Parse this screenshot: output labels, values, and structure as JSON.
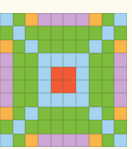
{
  "palette": {
    "B": "#a4d4f2",
    "G": "#7dbc3c",
    "O": "#f8b54a",
    "P": "#cda6d6",
    "R": "#f25a36"
  },
  "grid": {
    "rows": 10,
    "cols": 10,
    "cells": [
      [
        "B",
        "G",
        "O",
        "P",
        "P",
        "P",
        "P",
        "O",
        "G",
        "B"
      ],
      [
        "G",
        "B",
        "G",
        "G",
        "G",
        "G",
        "G",
        "G",
        "B",
        "G"
      ],
      [
        "O",
        "G",
        "B",
        "G",
        "G",
        "G",
        "G",
        "B",
        "G",
        "O"
      ],
      [
        "P",
        "G",
        "G",
        "B",
        "B",
        "B",
        "B",
        "G",
        "G",
        "P"
      ],
      [
        "P",
        "G",
        "G",
        "B",
        "R",
        "R",
        "B",
        "G",
        "G",
        "P"
      ],
      [
        "P",
        "G",
        "G",
        "B",
        "R",
        "R",
        "B",
        "G",
        "G",
        "P"
      ],
      [
        "P",
        "G",
        "G",
        "B",
        "B",
        "B",
        "B",
        "G",
        "G",
        "P"
      ],
      [
        "O",
        "G",
        "B",
        "G",
        "G",
        "G",
        "G",
        "B",
        "G",
        "O"
      ],
      [
        "G",
        "B",
        "G",
        "G",
        "G",
        "G",
        "G",
        "G",
        "B",
        "G"
      ],
      [
        "B",
        "G",
        "O",
        "P",
        "P",
        "P",
        "P",
        "O",
        "G",
        "B"
      ]
    ]
  }
}
